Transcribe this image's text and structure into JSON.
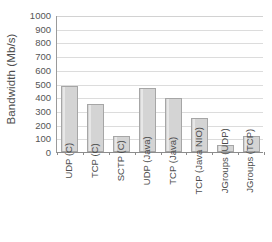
{
  "chart_data": {
    "type": "bar",
    "title": "",
    "subtitle": "",
    "xlabel": "",
    "ylabel": "Bandwidth (Mb/s)",
    "categories": [
      "UDP (C)",
      "TCP (C)",
      "SCTP (C)",
      "UDP (Java)",
      "TCP (Java)",
      "TCP (Java NIO)",
      "JGroups (UDP)",
      "JGroups (TCP)"
    ],
    "values": [
      480,
      350,
      115,
      465,
      395,
      250,
      52,
      118
    ],
    "ylim": [
      0,
      1000
    ],
    "ytick_step": 100,
    "ytick_labels": [
      "1000",
      "900",
      "800",
      "700",
      "600",
      "500",
      "400",
      "300",
      "200",
      "100",
      "0"
    ],
    "ytick_values": [
      1000,
      900,
      800,
      700,
      600,
      500,
      400,
      300,
      200,
      100,
      0
    ],
    "grid": "horizontal",
    "legend": "none",
    "bar_fill_color": "#d4d4d4",
    "bar_border_color": "#a6a6a6",
    "gridline_color": "#dcdcdc",
    "axis_color": "#8c8c8c",
    "plot_background": "#ffffff",
    "annotations": []
  }
}
